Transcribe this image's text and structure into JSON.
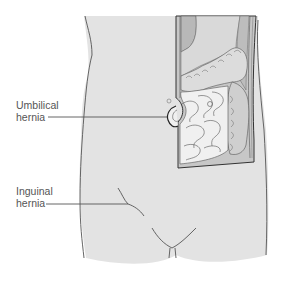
{
  "labels": {
    "umbilical": {
      "line1": "Umbilical",
      "line2": "hernia"
    },
    "inguinal": {
      "line1": "Inguinal",
      "line2": "hernia"
    }
  },
  "colors": {
    "skin": "#e3e3e3",
    "outline": "#444444",
    "leader_line": "#555555",
    "cavity_dark": "#c2c2c2",
    "intestine_fill": "#f0f0f0",
    "colon_fill": "#d6d6d6",
    "label_text": "#555555"
  }
}
